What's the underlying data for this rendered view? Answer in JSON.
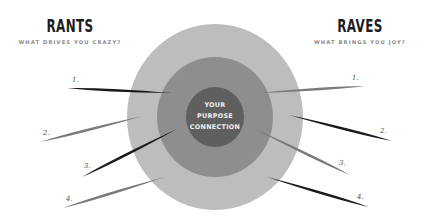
{
  "left_section": {
    "title": "RANTS",
    "subtitle": "WHAT DRIVES YOU CRAZY?",
    "items": [
      {
        "label": "1.",
        "tone": "dark"
      },
      {
        "label": "2.",
        "tone": "gray"
      },
      {
        "label": "3.",
        "tone": "dark"
      },
      {
        "label": "4.",
        "tone": "gray"
      }
    ]
  },
  "right_section": {
    "title": "RAVES",
    "subtitle": "WHAT BRINGS YOU JOY?",
    "items": [
      {
        "label": "1.",
        "tone": "gray"
      },
      {
        "label": "2.",
        "tone": "dark"
      },
      {
        "label": "3.",
        "tone": "gray"
      },
      {
        "label": "4.",
        "tone": "dark"
      }
    ]
  },
  "center": {
    "lines": [
      "YOUR",
      "PURPOSE",
      "CONNECTION"
    ]
  },
  "colors": {
    "outer_ring": "#bdbdbd",
    "middle_ring": "#8e8e8e",
    "inner_circle": "#5f5f5f",
    "spike_dark": "#1a1a1a",
    "spike_gray": "#7a7a7a",
    "title": "#1e1e1e",
    "subtitle": "#8a8a8a"
  }
}
